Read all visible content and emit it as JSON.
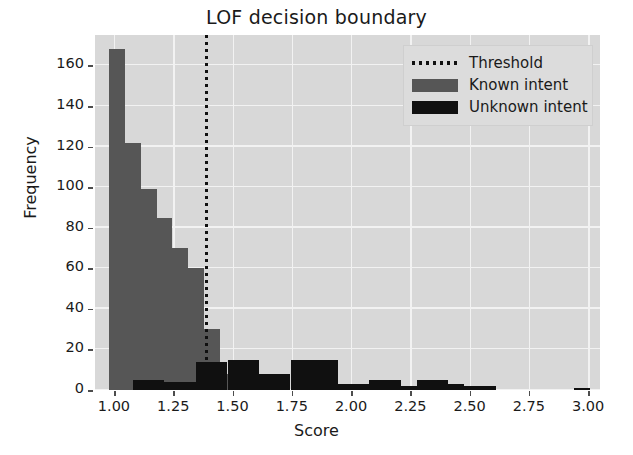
{
  "chart_data": {
    "type": "bar",
    "title": "LOF decision boundary",
    "xlabel": "Score",
    "ylabel": "Frequency",
    "xlim": [
      0.92,
      3.05
    ],
    "ylim": [
      0,
      175
    ],
    "grid": true,
    "legend_position": "upper right",
    "xticks": [
      "1.00",
      "1.25",
      "1.50",
      "1.75",
      "2.00",
      "2.25",
      "2.50",
      "2.75",
      "3.00"
    ],
    "xtick_values": [
      1.0,
      1.25,
      1.5,
      1.75,
      2.0,
      2.25,
      2.5,
      2.75,
      3.0
    ],
    "yticks": [
      "0",
      "20",
      "40",
      "60",
      "80",
      "100",
      "120",
      "140",
      "160"
    ],
    "ytick_values": [
      0,
      20,
      40,
      60,
      80,
      100,
      120,
      140,
      160
    ],
    "bin_width": 0.0665,
    "annotations": [
      {
        "name": "threshold",
        "value": 1.39,
        "label": "Threshold",
        "style": "dotted-vertical-line"
      }
    ],
    "series": [
      {
        "name": "Known intent",
        "color": "#565656",
        "bins": [
          0.98,
          1.047,
          1.113,
          1.18,
          1.246,
          1.313,
          1.379,
          1.446
        ],
        "values": [
          168,
          122,
          99,
          85,
          70,
          60,
          30,
          8
        ]
      },
      {
        "name": "Unknown intent",
        "color": "#101010",
        "bins": [
          1.08,
          1.146,
          1.213,
          1.279,
          1.346,
          1.412,
          1.479,
          1.545,
          1.612,
          1.678,
          1.745,
          1.811,
          1.878,
          1.944,
          2.011,
          2.077,
          2.144,
          2.21,
          2.277,
          2.343,
          2.41,
          2.476,
          2.543,
          2.94
        ],
        "values": [
          5,
          5,
          4,
          4,
          14,
          14,
          15,
          15,
          8,
          8,
          15,
          15,
          15,
          3,
          3,
          5,
          5,
          2,
          5,
          5,
          3,
          2,
          2,
          1
        ]
      }
    ]
  },
  "legend": {
    "entries": [
      {
        "label": "Threshold",
        "key": "dotted-line"
      },
      {
        "label": "Known intent",
        "key": "gray-patch"
      },
      {
        "label": "Unknown intent",
        "key": "black-patch"
      }
    ]
  },
  "colors": {
    "known_intent": "#565656",
    "unknown_intent": "#101010",
    "threshold": "#101010",
    "plot_background": "#d8d8d8",
    "gridline": "#f2f2f2",
    "figure_background": "#ffffff",
    "text": "#1a1a1a"
  }
}
